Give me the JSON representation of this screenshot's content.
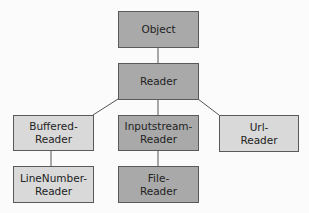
{
  "diagram": {
    "colors": {
      "dark": "#a9a9a9",
      "light": "#d9d9d9",
      "border": "#5a5a5a",
      "line": "#555555"
    },
    "nodes": {
      "object": {
        "lines": [
          "Object"
        ],
        "style": "dark"
      },
      "reader": {
        "lines": [
          "Reader"
        ],
        "style": "dark"
      },
      "buffered": {
        "lines": [
          "Buffered-",
          "Reader"
        ],
        "style": "light"
      },
      "inputstream": {
        "lines": [
          "Inputstream-",
          "Reader"
        ],
        "style": "dark"
      },
      "url": {
        "lines": [
          "Url-",
          "Reader"
        ],
        "style": "light"
      },
      "linenumber": {
        "lines": [
          "LineNumber-",
          "Reader"
        ],
        "style": "light"
      },
      "file": {
        "lines": [
          "File-",
          "Reader"
        ],
        "style": "dark"
      }
    },
    "edges": [
      [
        "object",
        "reader"
      ],
      [
        "reader",
        "buffered"
      ],
      [
        "reader",
        "inputstream"
      ],
      [
        "reader",
        "url"
      ],
      [
        "buffered",
        "linenumber"
      ],
      [
        "inputstream",
        "file"
      ]
    ]
  }
}
